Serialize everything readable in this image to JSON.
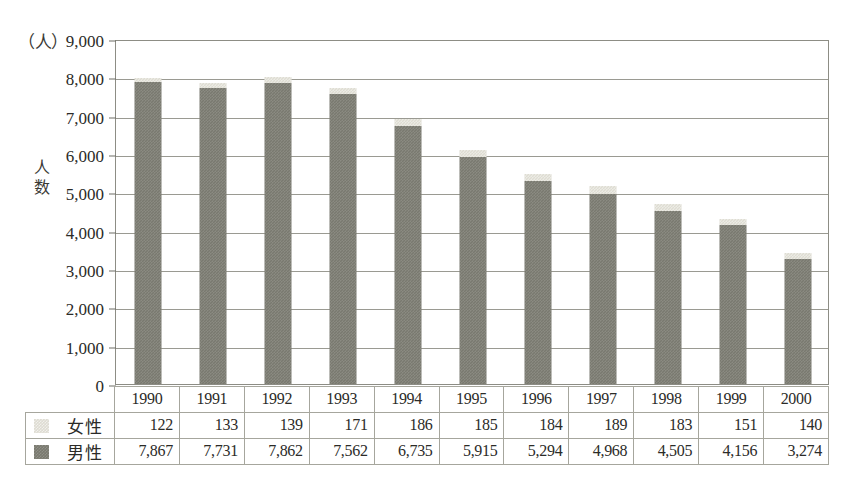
{
  "chart_data": {
    "type": "bar",
    "subtype": "stacked-column",
    "title": "",
    "xlabel": "",
    "ylabel": "人数",
    "unit_label": "（人）",
    "ylim": [
      0,
      9000
    ],
    "ytick_step": 1000,
    "yticks": [
      "9,000",
      "8,000",
      "7,000",
      "6,000",
      "5,000",
      "4,000",
      "3,000",
      "2,000",
      "1,000",
      "0"
    ],
    "ytick_values": [
      9000,
      8000,
      7000,
      6000,
      5000,
      4000,
      3000,
      2000,
      1000,
      0
    ],
    "grid": true,
    "legend_position": "table-left",
    "categories": [
      "1990",
      "1991",
      "1992",
      "1993",
      "1994",
      "1995",
      "1996",
      "1997",
      "1998",
      "1999",
      "2000"
    ],
    "series": [
      {
        "name": "女性",
        "order": "top",
        "color": "#dedcd2",
        "values": [
          122,
          133,
          139,
          171,
          186,
          185,
          184,
          189,
          183,
          151,
          140
        ],
        "labels": [
          "122",
          "133",
          "139",
          "171",
          "186",
          "185",
          "184",
          "189",
          "183",
          "151",
          "140"
        ]
      },
      {
        "name": "男性",
        "order": "bottom",
        "color": "#79796f",
        "values": [
          7867,
          7731,
          7862,
          7562,
          6735,
          5915,
          5294,
          4968,
          4505,
          4156,
          3274
        ],
        "labels": [
          "7,867",
          "7,731",
          "7,862",
          "7,562",
          "6,735",
          "5,915",
          "5,294",
          "4,968",
          "4,505",
          "4,156",
          "3,274"
        ]
      }
    ],
    "totals": [
      7989,
      7864,
      8001,
      7733,
      6921,
      6100,
      5478,
      5157,
      4688,
      4307,
      3414
    ]
  },
  "table": {
    "corner_label": "",
    "header_row": [
      "1990",
      "1991",
      "1992",
      "1993",
      "1994",
      "1995",
      "1996",
      "1997",
      "1998",
      "1999",
      "2000"
    ],
    "rows": [
      {
        "legend_label": "女性",
        "swatch": "female-swatch",
        "values": [
          "122",
          "133",
          "139",
          "171",
          "186",
          "185",
          "184",
          "189",
          "183",
          "151",
          "140"
        ]
      },
      {
        "legend_label": "男性",
        "swatch": "male-swatch",
        "values": [
          "7,867",
          "7,731",
          "7,862",
          "7,562",
          "6,735",
          "5,915",
          "5,294",
          "4,968",
          "4,505",
          "4,156",
          "3,274"
        ]
      }
    ]
  },
  "colors": {
    "female": "#dedcd2",
    "male": "#79796f",
    "grid": "#9a9a92",
    "frame": "#8d8d85",
    "text": "#2b2b28"
  }
}
